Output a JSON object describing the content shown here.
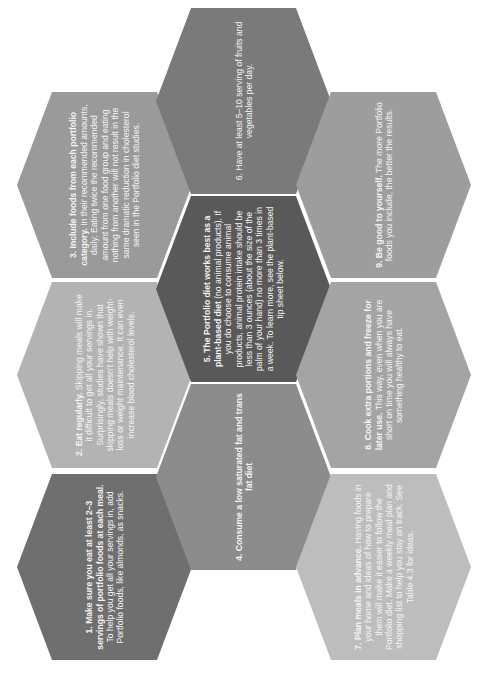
{
  "document": {
    "orientation": "rotated-90-ccw",
    "tips": [
      {
        "id": 1,
        "lead": "1. Make sure you eat at least 2–3 servings of portfolio foods at each meal.",
        "body": " To help you get all your servings in, add Portfolio foods, like almonds, as snacks.",
        "color": "#6f6f6f"
      },
      {
        "id": 2,
        "lead": "2. Eat regularly.",
        "body": " Skipping meals will make it difficult to get all your servings in. Surprisingly, studies have shown that skipping meals doesn't help with weight-loss or weight maintenance. It can even increase blood cholesterol levels.",
        "color": "#b3b3b3"
      },
      {
        "id": 3,
        "lead": "3. Include foods from each portfolio category.",
        "body": " In their recommended amounts, daily. Eating twice the recommended amount from one food group and eating nothing from another will not result in the same dramatic reduction in cholesterol seen in the Portfolio diet studies.",
        "color": "#9a9a9a"
      },
      {
        "id": 4,
        "lead": "4. Consume a low saturated fat and trans fat diet",
        "body": "",
        "color": "#8c8c8c"
      },
      {
        "id": 5,
        "lead": "5. The Portfolio diet works best as a plant-based diet",
        "body": " (no animal products). If you do choose to consume animal products, animal protein intake should be less than 3 ounces (about the size of the palm of your hand) no more than 3 times in a week. To learn more, see the plant-based tip sheet below.",
        "color": "#595959"
      },
      {
        "id": 6,
        "lead": "",
        "body": "6. Have at least 5–10 serving of fruits and vegetables per day.",
        "color": "#7a7a7a"
      },
      {
        "id": 7,
        "lead": "7. Plan meals in advance.",
        "body": " Having foods in your home and ideas of how to prepare them will make it easier to follow the Portfolio diet. Make a weekly meal plan and shopping list to help you stay on track. See Table 4.3 for ideas.",
        "color": "#bdbdbd"
      },
      {
        "id": 8,
        "lead": "8. Cook extra portions and freeze for later use.",
        "body": " This way, even when you are short on time you will always have something healthy to eat.",
        "color": "#a4a4a4"
      },
      {
        "id": 9,
        "lead": "9. Be good to yourself.",
        "body": " The more Portfolio foods you include, the better the results.",
        "color": "#9d9d9d"
      }
    ]
  }
}
